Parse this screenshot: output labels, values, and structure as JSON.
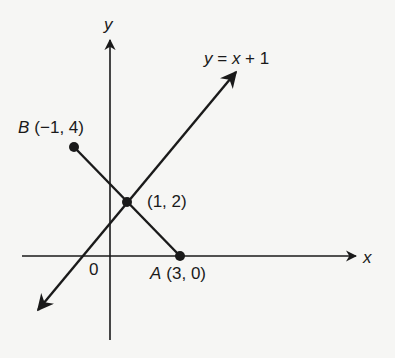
{
  "diagram": {
    "axes": {
      "x_label": "x",
      "y_label": "y",
      "origin_label": "0"
    },
    "line": {
      "equation": "y = x + 1",
      "eq_var_y": "y",
      "eq_eq": " = ",
      "eq_var_x": "x",
      "eq_rest": " + 1"
    },
    "points": [
      {
        "name": "B",
        "coords": "(−1, 4)"
      },
      {
        "name": "",
        "coords": "(1, 2)"
      },
      {
        "name": "A",
        "coords": "(3, 0)"
      }
    ],
    "colors": {
      "ink": "#1a1a1a",
      "background": "#f6f6f4"
    }
  }
}
